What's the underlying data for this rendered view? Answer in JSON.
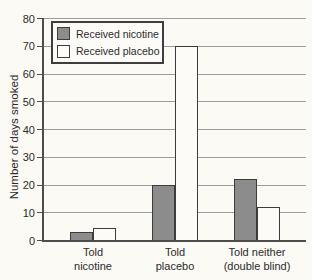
{
  "figure": {
    "ylabel": "Number of days smoked",
    "legend": {
      "items": [
        {
          "label": "Received nicotine",
          "swatch": "dark-gray"
        },
        {
          "label": "Received placebo",
          "swatch": "white"
        }
      ]
    }
  },
  "chart_data": {
    "type": "bar",
    "title": "",
    "xlabel": "",
    "ylabel": "Number of days smoked",
    "ylim": [
      0,
      80
    ],
    "yticks": [
      0,
      10,
      20,
      30,
      40,
      50,
      60,
      70,
      80
    ],
    "grid": true,
    "legend_position": "top-left-inside",
    "categories": [
      "Told\nnicotine",
      "Told\nplacebo",
      "Told neither\n(double blind)"
    ],
    "series": [
      {
        "name": "Received nicotine",
        "color": "#8c8c8c",
        "values": [
          3,
          20,
          22
        ]
      },
      {
        "name": "Received placebo",
        "color": "#fcfbf7",
        "values": [
          4.5,
          70,
          12
        ]
      }
    ],
    "style": {
      "background": "#fbfaf5",
      "gridline_color": "#9c9c9c",
      "axis_color": "#4d4d4d",
      "bar_border_color": "#3c3c3c",
      "text_color": "#2b2b2b"
    }
  }
}
